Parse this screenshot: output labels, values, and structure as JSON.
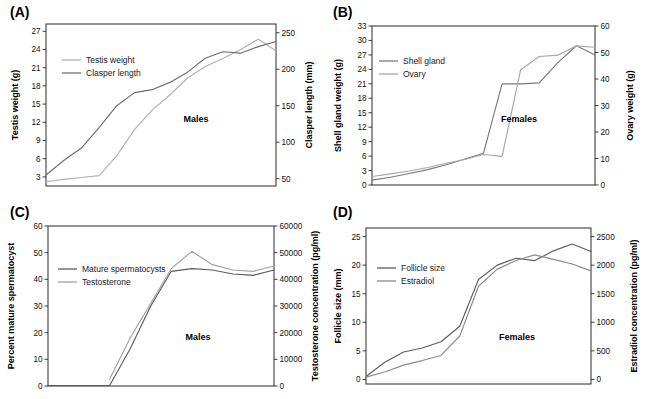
{
  "figure": {
    "panels": [
      {
        "id": "A",
        "label": "(A)",
        "annotation": "Males",
        "left_axis_title": "Testis weight (g)",
        "right_axis_title": "Clasper length (mm)",
        "left_ticks": [
          "3",
          "6",
          "9",
          "12",
          "15",
          "18",
          "21",
          "24",
          "27"
        ],
        "right_ticks": [
          "50",
          "100",
          "150",
          "200",
          "250"
        ],
        "legend": [
          {
            "label": "Testis weight",
            "color": "#b0b0b0"
          },
          {
            "label": "Clasper length",
            "color": "#6e6e6e"
          }
        ]
      },
      {
        "id": "B",
        "label": "(B)",
        "annotation": "Females",
        "left_axis_title": "Shell gland weight (g)",
        "right_axis_title": "Ovary weight (g)",
        "left_ticks": [
          "0",
          "3",
          "6",
          "9",
          "12",
          "15",
          "18",
          "21",
          "24",
          "27",
          "30",
          "33"
        ],
        "right_ticks": [
          "0",
          "10",
          "20",
          "30",
          "40",
          "50",
          "60"
        ],
        "legend": [
          {
            "label": "Shell gland",
            "color": "#7a7a7a"
          },
          {
            "label": "Ovary",
            "color": "#a8a8a8"
          }
        ]
      },
      {
        "id": "C",
        "label": "(C)",
        "annotation": "Males",
        "left_axis_title": "Percent mature spermatocyst",
        "right_axis_title": "Testosterone concentration (pg/ml)",
        "left_ticks": [
          "0",
          "10",
          "20",
          "30",
          "40",
          "50",
          "60"
        ],
        "right_ticks": [
          "0",
          "10000",
          "20000",
          "30000",
          "40000",
          "50000",
          "60000"
        ],
        "legend": [
          {
            "label": "Mature spermatocysts",
            "color": "#5c5c5c"
          },
          {
            "label": "Testosterone",
            "color": "#a0a0a0"
          }
        ]
      },
      {
        "id": "D",
        "label": "(D)",
        "annotation": "Females",
        "left_axis_title": "Follicle size (mm)",
        "right_axis_title": "Estradiol concentration (pg/ml)",
        "left_ticks": [
          "0",
          "5",
          "10",
          "15",
          "20",
          "25"
        ],
        "right_ticks": [
          "0",
          "500",
          "1000",
          "1500",
          "2000",
          "2500"
        ],
        "legend": [
          {
            "label": "Follicle size",
            "color": "#5c5c5c"
          },
          {
            "label": "Estradiol",
            "color": "#8a8a8a"
          }
        ]
      }
    ]
  },
  "chart_data": [
    {
      "type": "line",
      "panel": "A",
      "title": "(A) Males",
      "annotation": "Males",
      "xlabel": "",
      "ylabel": "Testis weight (g)",
      "y2label": "Clasper length (mm)",
      "ylim": [
        1.5,
        28.2
      ],
      "y2lim": [
        40,
        262
      ],
      "yticks": [
        3,
        6,
        9,
        12,
        15,
        18,
        21,
        24,
        27
      ],
      "y2ticks": [
        50,
        100,
        150,
        200,
        250
      ],
      "grid": false,
      "legend_position": "upper-left",
      "x": [
        1,
        2,
        3,
        4,
        5,
        6,
        7,
        8,
        9,
        10,
        11,
        12,
        13,
        14
      ],
      "series": [
        {
          "name": "Testis weight",
          "axis": "left",
          "color": "#b0b0b0",
          "values": [
            2.2,
            2.6,
            2.9,
            3.2,
            6.5,
            10.8,
            14.0,
            16.5,
            19.3,
            21.2,
            22.5,
            24.0,
            25.7,
            23.8
          ]
        },
        {
          "name": "Clasper length",
          "axis": "right",
          "color": "#6e6e6e",
          "values": [
            55,
            75,
            92,
            120,
            150,
            168,
            172,
            182,
            196,
            215,
            224,
            222,
            231,
            238
          ]
        }
      ]
    },
    {
      "type": "line",
      "panel": "B",
      "title": "(B) Females",
      "annotation": "Females",
      "xlabel": "",
      "ylabel": "Shell gland weight (g)",
      "y2label": "Ovary weight (g)",
      "ylim": [
        0,
        33
      ],
      "y2lim": [
        0,
        60
      ],
      "yticks": [
        0,
        3,
        6,
        9,
        12,
        15,
        18,
        21,
        24,
        27,
        30,
        33
      ],
      "y2ticks": [
        0,
        10,
        20,
        30,
        40,
        50,
        60
      ],
      "grid": false,
      "legend_position": "upper-left",
      "x": [
        1,
        2,
        3,
        4,
        5,
        6,
        7,
        8,
        9,
        10,
        11,
        12,
        13
      ],
      "series": [
        {
          "name": "Shell gland",
          "axis": "left",
          "color": "#7a7a7a",
          "values": [
            1.0,
            1.6,
            2.4,
            3.2,
            4.2,
            5.4,
            6.6,
            21.0,
            21.0,
            21.2,
            25.4,
            28.9,
            27.0
          ]
        },
        {
          "name": "Ovary",
          "axis": "right",
          "color": "#a8a8a8",
          "values": [
            3.2,
            4.2,
            5.3,
            6.6,
            8.2,
            9.6,
            11.5,
            10.8,
            43.5,
            48.5,
            49.0,
            52.5,
            52.0
          ]
        }
      ]
    },
    {
      "type": "line",
      "panel": "C",
      "title": "(C) Males",
      "annotation": "Males",
      "xlabel": "",
      "ylabel": "Percent mature spermatocyst",
      "y2label": "Testosterone concentration (pg/ml)",
      "ylim": [
        0,
        60
      ],
      "y2lim": [
        0,
        60000
      ],
      "yticks": [
        0,
        10,
        20,
        30,
        40,
        50,
        60
      ],
      "y2ticks": [
        0,
        10000,
        20000,
        30000,
        40000,
        50000,
        60000
      ],
      "grid": false,
      "legend_position": "upper-left",
      "x": [
        1,
        2,
        3,
        4,
        5,
        6,
        7,
        8,
        9,
        10,
        11,
        12
      ],
      "series": [
        {
          "name": "Mature spermatocysts",
          "axis": "left",
          "color": "#5c5c5c",
          "values": [
            0.2,
            0.2,
            0.2,
            0.2,
            14.0,
            30.0,
            43.0,
            44.0,
            43.5,
            42.0,
            41.5,
            43.5
          ]
        },
        {
          "name": "Testosterone",
          "axis": "right",
          "color": "#a0a0a0",
          "values": [
            null,
            null,
            null,
            2600,
            18000,
            31000,
            44000,
            50500,
            45500,
            43500,
            43000,
            45000
          ]
        }
      ]
    },
    {
      "type": "line",
      "panel": "D",
      "title": "(D) Females",
      "annotation": "Females",
      "xlabel": "",
      "ylabel": "Follicle size (mm)",
      "y2label": "Estradiol concentration (pg/ml)",
      "ylim": [
        -0.8,
        26.5
      ],
      "y2lim": [
        -80,
        2650
      ],
      "yticks": [
        0,
        5,
        10,
        15,
        20,
        25
      ],
      "y2ticks": [
        0,
        500,
        1000,
        1500,
        2000,
        2500
      ],
      "grid": false,
      "legend_position": "upper-left",
      "x": [
        1,
        2,
        3,
        4,
        5,
        6,
        7,
        8,
        9,
        10,
        11,
        12,
        13
      ],
      "series": [
        {
          "name": "Follicle size",
          "axis": "left",
          "color": "#5c5c5c",
          "values": [
            0.5,
            3.0,
            4.8,
            5.5,
            6.6,
            9.3,
            17.5,
            20.0,
            21.2,
            20.8,
            22.5,
            23.7,
            22.4
          ]
        },
        {
          "name": "Estradiol",
          "axis": "right",
          "color": "#8a8a8a",
          "values": [
            40,
            130,
            250,
            330,
            420,
            760,
            1630,
            1930,
            2080,
            2180,
            2100,
            2020,
            1900
          ]
        }
      ]
    }
  ]
}
